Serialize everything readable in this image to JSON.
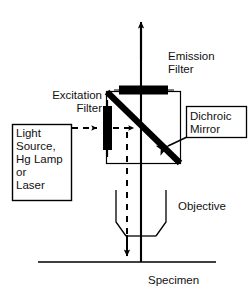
{
  "diagram": {
    "stroke_color": "#000000",
    "background_color": "#ffffff",
    "labels": {
      "light_source": "Light\nSource,\nHg Lamp\nor\nLaser",
      "excitation_filter": "Excitation\nFilter",
      "emission_filter": "Emission\nFilter",
      "dichroic_mirror": "Dichroic\nMirror",
      "objective": "Objective",
      "specimen": "Specimen"
    },
    "components": [
      {
        "name": "light-source-box",
        "label": "Light Source, Hg Lamp or Laser",
        "shape": "rectangle"
      },
      {
        "name": "excitation-filter",
        "label": "Excitation Filter",
        "shape": "vertical-bar",
        "fill": "#000000"
      },
      {
        "name": "emission-filter",
        "label": "Emission Filter",
        "shape": "horizontal-bar",
        "fill": "#000000"
      },
      {
        "name": "dichroic-mirror",
        "label": "Dichroic Mirror",
        "shape": "diagonal-bar",
        "fill": "#000000"
      },
      {
        "name": "filter-cube",
        "label": "Filter Cube",
        "shape": "rectangle"
      },
      {
        "name": "objective",
        "label": "Objective",
        "shape": "lens-cone"
      },
      {
        "name": "specimen",
        "label": "Specimen",
        "shape": "horizontal-line"
      }
    ],
    "beams": [
      {
        "name": "excitation-beam",
        "style": "dashed",
        "direction": "left-to-right-then-down",
        "from": "light-source-box",
        "to": "specimen"
      },
      {
        "name": "emission-beam",
        "style": "solid",
        "direction": "upward",
        "from": "specimen",
        "to": "emission-filter"
      }
    ]
  }
}
